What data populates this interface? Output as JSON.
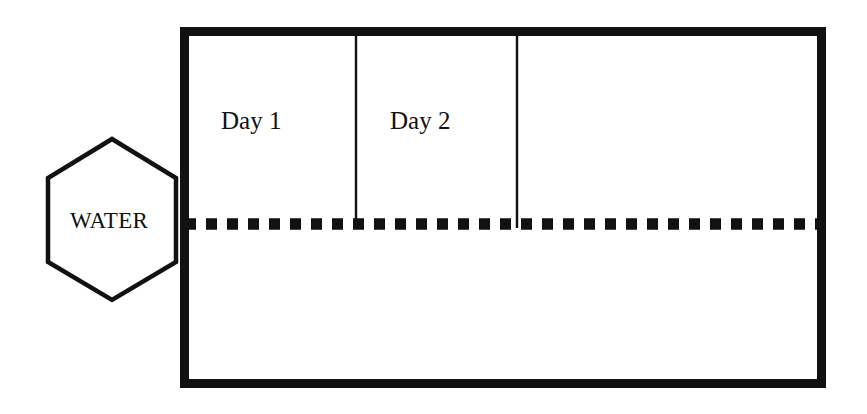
{
  "diagram": {
    "colors": {
      "stroke": "#111111",
      "background": "#ffffff"
    },
    "tank": {
      "name": "tank-rectangle",
      "border_thickness_px": 9,
      "x": 180,
      "y": 27,
      "width": 646,
      "height": 361
    },
    "source": {
      "name": "water-source-hexagon",
      "label": "WATER",
      "center_x": 112,
      "center_y": 220,
      "width": 128,
      "height": 161,
      "stroke_width_px": 4
    },
    "water_line": {
      "name": "water-level-dotted-line",
      "style": "dotted",
      "dot_size_px": 11,
      "dot_gap_px": 10,
      "y": 224,
      "x_start": 180,
      "x_end": 818
    },
    "dividers": [
      {
        "name": "day-1-divider",
        "x": 356,
        "y_top": 33,
        "y_bottom": 228,
        "stroke_width_px": 2
      },
      {
        "name": "day-2-divider",
        "x": 517,
        "y_top": 33,
        "y_bottom": 228,
        "stroke_width_px": 2
      }
    ],
    "labels": {
      "water": "WATER",
      "day1": "Day 1",
      "day2": "Day 2"
    }
  }
}
